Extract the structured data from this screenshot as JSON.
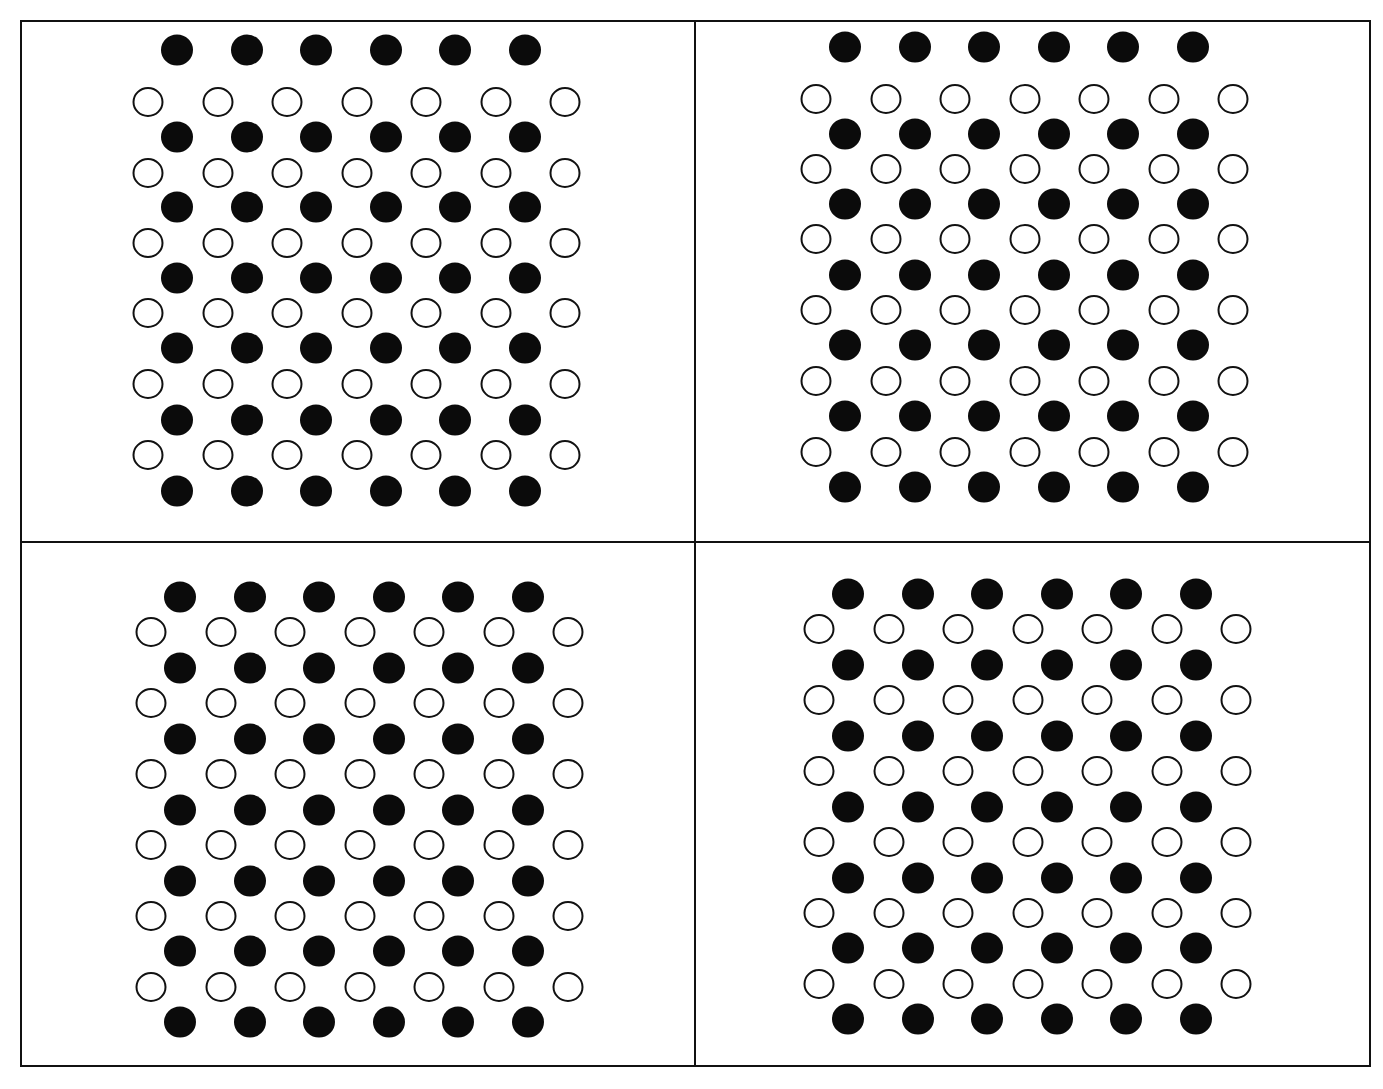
{
  "figure": {
    "layout": "2x2 grid of panels",
    "colors": {
      "filled_dot": "#0b0b0b",
      "open_dot_stroke": "#111111",
      "border": "#111111",
      "background": "#ffffff"
    },
    "panels": [
      {
        "id": "top-left",
        "rows": 13,
        "pattern": [
          "filled",
          "open",
          "filled",
          "open",
          "filled",
          "open",
          "filled",
          "open",
          "filled",
          "open",
          "filled",
          "open",
          "filled"
        ],
        "filled_per_row": 6,
        "open_per_row": 7,
        "origin": {
          "filled_x": 177,
          "open_x": 148
        },
        "col_spacing": 69.5,
        "row_y": [
          50,
          102,
          137,
          173,
          207,
          243,
          278,
          313,
          348,
          384,
          420,
          455,
          491
        ]
      },
      {
        "id": "top-right",
        "rows": 13,
        "pattern": [
          "filled",
          "open",
          "filled",
          "open",
          "filled",
          "open",
          "filled",
          "open",
          "filled",
          "open",
          "filled",
          "open",
          "filled"
        ],
        "filled_per_row": 6,
        "open_per_row": 7,
        "origin": {
          "filled_x": 845,
          "open_x": 816
        },
        "col_spacing": 69.5,
        "row_y": [
          47,
          99,
          134,
          169,
          204,
          239,
          275,
          310,
          345,
          381,
          416,
          452,
          487
        ]
      },
      {
        "id": "bottom-left",
        "rows": 13,
        "pattern": [
          "filled",
          "open",
          "filled",
          "open",
          "filled",
          "open",
          "filled",
          "open",
          "filled",
          "open",
          "filled",
          "open",
          "filled"
        ],
        "filled_per_row": 6,
        "open_per_row": 7,
        "origin": {
          "filled_x": 180,
          "open_x": 151
        },
        "col_spacing": 69.5,
        "row_y": [
          597,
          632,
          668,
          703,
          739,
          774,
          810,
          845,
          881,
          916,
          951,
          987,
          1022
        ]
      },
      {
        "id": "bottom-right",
        "rows": 13,
        "pattern": [
          "filled",
          "open",
          "filled",
          "open",
          "filled",
          "open",
          "filled",
          "open",
          "filled",
          "open",
          "filled",
          "open",
          "filled"
        ],
        "filled_per_row": 6,
        "open_per_row": 7,
        "origin": {
          "filled_x": 848,
          "open_x": 819
        },
        "col_spacing": 69.5,
        "row_y": [
          594,
          629,
          665,
          700,
          736,
          771,
          807,
          842,
          878,
          913,
          948,
          984,
          1019
        ]
      }
    ]
  }
}
